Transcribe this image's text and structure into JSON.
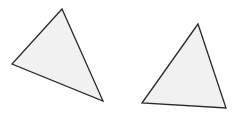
{
  "diagram": {
    "background": "#ffffff",
    "fill": "#f1f1f1",
    "stroke": "#2a2a2a",
    "shapes": [
      {
        "name": "triangle-left",
        "points": "62,9 12,64 103,101"
      },
      {
        "name": "triangle-right",
        "points": "198,24 142,103 226,108"
      }
    ]
  }
}
